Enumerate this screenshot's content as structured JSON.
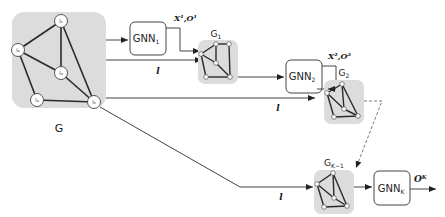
{
  "diagram": {
    "input_graph": {
      "label": "G",
      "nodes": [
        "l1",
        "l2",
        "l3",
        "l4",
        "l5"
      ],
      "node_labels": [
        "l₁",
        "l₂",
        "l₃",
        "l₄",
        "l₅"
      ]
    },
    "gnn_blocks": [
      {
        "label": "GNN",
        "sub": "1"
      },
      {
        "label": "GNN",
        "sub": "2"
      },
      {
        "label": "GNN",
        "sub": "K"
      }
    ],
    "intermediate_graphs": [
      {
        "label": "G",
        "sub": "1"
      },
      {
        "label": "G",
        "sub": "2"
      },
      {
        "label": "G",
        "sub": "K−1"
      }
    ],
    "edge_labels": {
      "x1o1": "X¹,O¹",
      "x2o2": "X²,O²",
      "ok": "Oᴷ",
      "l": "l"
    },
    "colors": {
      "graph_bg": "#dcdcdc",
      "line": "#333333",
      "dashed": "#777777"
    }
  }
}
